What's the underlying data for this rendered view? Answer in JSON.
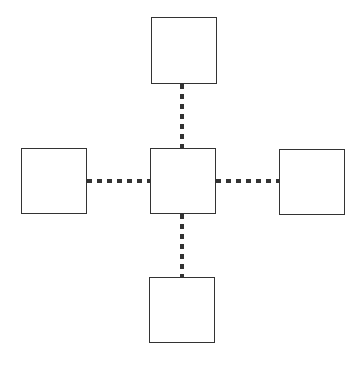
{
  "diagram": {
    "type": "hub-and-spoke",
    "nodes": [
      {
        "id": "center",
        "label": ""
      },
      {
        "id": "top",
        "label": ""
      },
      {
        "id": "left",
        "label": ""
      },
      {
        "id": "right",
        "label": ""
      },
      {
        "id": "bottom",
        "label": ""
      }
    ],
    "edges": [
      {
        "from": "center",
        "to": "top",
        "style": "dotted"
      },
      {
        "from": "center",
        "to": "left",
        "style": "dotted"
      },
      {
        "from": "center",
        "to": "right",
        "style": "dotted"
      },
      {
        "from": "center",
        "to": "bottom",
        "style": "dotted"
      }
    ],
    "colors": {
      "stroke": "#333333",
      "fill": "#ffffff"
    }
  }
}
